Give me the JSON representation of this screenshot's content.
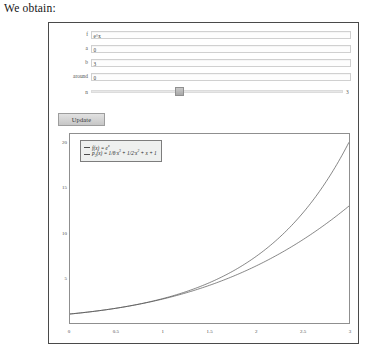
{
  "page": {
    "intro_text": "We obtain:"
  },
  "form": {
    "rows": [
      {
        "label": "f",
        "value": "e^x",
        "name": "function-field"
      },
      {
        "label": "a",
        "value": "0",
        "name": "lower-bound-field"
      },
      {
        "label": "b",
        "value": "3",
        "name": "upper-bound-field"
      },
      {
        "label": "around",
        "value": "0",
        "name": "around-field"
      }
    ],
    "slider": {
      "label": "n",
      "value": "3",
      "handle_percent": 35
    },
    "update_label": "Update"
  },
  "chart_data": {
    "type": "line",
    "title": "",
    "xlabel": "",
    "ylabel": "",
    "xlim": [
      0,
      3
    ],
    "ylim": [
      0,
      21
    ],
    "grid": false,
    "legend_position": "top-left",
    "x_ticks": [
      "0",
      "0.5",
      "1",
      "1.5",
      "2",
      "2.5",
      "3"
    ],
    "x_tick_values": [
      0,
      0.5,
      1,
      1.5,
      2,
      2.5,
      3
    ],
    "y_ticks": [
      "5",
      "10",
      "15",
      "20"
    ],
    "y_tick_values": [
      5,
      10,
      15,
      20
    ],
    "series": [
      {
        "name": "f(x) = e^x",
        "legend_label_html": "f(x) = e<sup>x</sup>",
        "color": "#4d4d4d",
        "x": [
          0,
          0.25,
          0.5,
          0.75,
          1,
          1.25,
          1.5,
          1.75,
          2,
          2.25,
          2.5,
          2.75,
          3
        ],
        "values": [
          1,
          1.284,
          1.649,
          2.117,
          2.718,
          3.49,
          4.482,
          5.755,
          7.389,
          9.488,
          12.182,
          15.643,
          20.086
        ]
      },
      {
        "name": "p3(x) = 1/6*x^3 + 1/2*x^2 + x + 1",
        "legend_label_html": "p<sub>3</sub>(x) = 1/6&#183;x<sup>3</sup> + 1/2&#183;x<sup>2</sup> + x + 1",
        "color": "#4d4d4d",
        "x": [
          0,
          0.25,
          0.5,
          0.75,
          1,
          1.25,
          1.5,
          1.75,
          2,
          2.25,
          2.5,
          2.75,
          3
        ],
        "values": [
          1,
          1.285,
          1.646,
          2.086,
          2.667,
          3.357,
          4.188,
          5.174,
          6.333,
          7.68,
          9.229,
          10.997,
          13.0
        ]
      }
    ]
  }
}
